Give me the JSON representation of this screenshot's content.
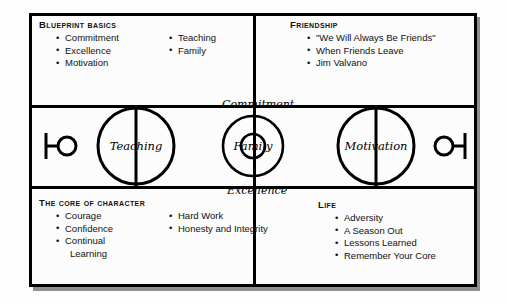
{
  "diagram": {
    "background_color": "#fdfdfd",
    "line_color": "#000000",
    "frame_color": "#000000"
  },
  "panels": {
    "blueprint": {
      "heading": "Blueprint Basics",
      "column_left": [
        "Commitment",
        "Excellence",
        "Motivation"
      ],
      "column_right": [
        "Teaching",
        "Family"
      ]
    },
    "friendship": {
      "heading": "Friendship",
      "items": [
        "\"We Will Always Be Friends\"",
        "When Friends Leave",
        "Jim Valvano"
      ]
    },
    "core": {
      "heading": "The Core of Character",
      "column_left": [
        "Courage",
        "Confidence",
        "Continual",
        "Learning"
      ],
      "column_right": [
        "Hard Work",
        "Honesty and Integrity"
      ]
    },
    "life": {
      "heading": "Life",
      "items": [
        "Adversity",
        "A Season Out",
        "Lessons Learned",
        "Remember Your Core"
      ]
    }
  },
  "court": {
    "left_circle_label": "Teaching",
    "center_circle_label": "Family",
    "right_circle_label": "Motivation",
    "top_center_label": "Commitment",
    "bottom_center_label": "Excellence",
    "left_hoop": "basketball-hoop-icon",
    "right_hoop": "basketball-hoop-icon"
  }
}
